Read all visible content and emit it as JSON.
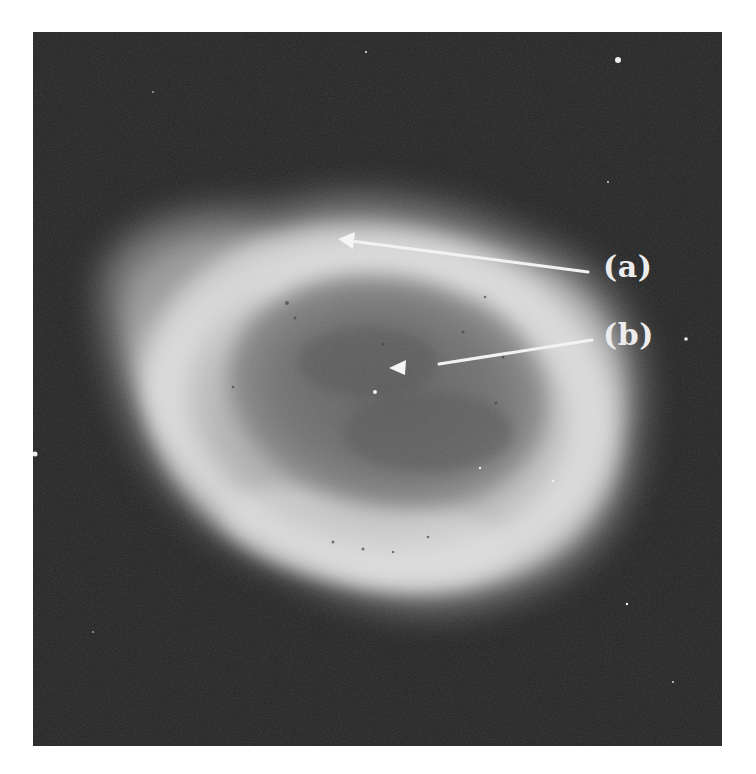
{
  "figure": {
    "background_color": "#222222",
    "page_color": "#ffffff",
    "annotations": [
      {
        "id": "a",
        "label": "(a)",
        "points_to": "bright outer ring rim (top)"
      },
      {
        "id": "b",
        "label": "(b)",
        "points_to": "central star region"
      }
    ],
    "annotation_color": "#ececec"
  }
}
